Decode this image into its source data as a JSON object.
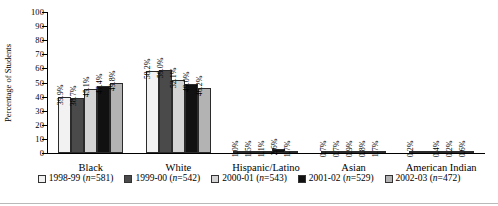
{
  "chart_data": {
    "type": "bar",
    "title": "",
    "subtitle": "",
    "xlabel": "",
    "ylabel": "Percentage of Students",
    "ylim": [
      0,
      100
    ],
    "yticks": [
      0,
      10,
      20,
      30,
      40,
      50,
      60,
      70,
      80,
      90,
      100
    ],
    "grid": false,
    "legend_position": "bottom",
    "categories": [
      "Black",
      "White",
      "Hispanic/Latino",
      "Asian",
      "American Indian"
    ],
    "series": [
      {
        "name": "1998-99 (n=581)",
        "label_year": "1998-99",
        "label_n": "(n=581)",
        "n": 581,
        "color": "#f2f2f2",
        "values": [
          39.9,
          58.2,
          1.0,
          0.7,
          0.2
        ],
        "data_labels": [
          "39.9%",
          "58.2%",
          "1.0%",
          "0.7%",
          "0.2%"
        ]
      },
      {
        "name": "1999-00 (n=542)",
        "label_year": "1999-00",
        "label_n": "(n=542)",
        "n": 542,
        "color": "#4a4a4a",
        "values": [
          38.7,
          59.0,
          1.5,
          0.7,
          0.0
        ],
        "data_labels": [
          "38.7%",
          "59.0%",
          "1.5%",
          "0.7%",
          ""
        ]
      },
      {
        "name": "2000-01 (n=543)",
        "label_year": "2000-01",
        "label_n": "(n=543)",
        "n": 543,
        "color": "#d4d4d4",
        "values": [
          45.1,
          52.1,
          1.1,
          0.9,
          0.4
        ],
        "data_labels": [
          "45.1%",
          "52.1%",
          "1.1%",
          "0.9%",
          "0.4%"
        ]
      },
      {
        "name": "2001-02 (n=529)",
        "label_year": "2001-02",
        "label_n": "(n=529)",
        "n": 529,
        "color": "#111111",
        "values": [
          47.4,
          49.0,
          2.6,
          0.8,
          0.2
        ],
        "data_labels": [
          "47.4%",
          "49.0%",
          "2.6%",
          "0.8%",
          "0.2%"
        ]
      },
      {
        "name": "2002-03 (n=472)",
        "label_year": "2002-03",
        "label_n": "(n=472)",
        "n": 472,
        "color": "#b3b3b3",
        "values": [
          49.8,
          46.2,
          1.7,
          1.7,
          0.6
        ],
        "data_labels": [
          "49.8%",
          "46.2%",
          "1.7%",
          "1.7%",
          "0.6%"
        ]
      }
    ]
  }
}
